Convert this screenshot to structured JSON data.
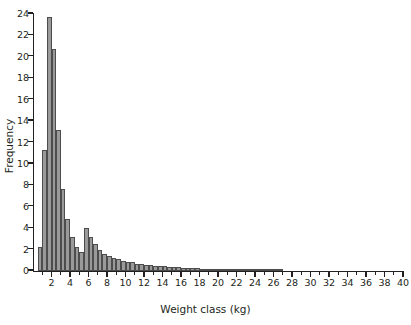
{
  "chart_data": {
    "type": "bar",
    "title": "",
    "subtitle": "",
    "xlabel": "Weight class (kg)",
    "ylabel": "Frequency",
    "xlim": [
      0,
      40
    ],
    "ylim": [
      0,
      24
    ],
    "grid": false,
    "legend": null,
    "bin_width": 0.5,
    "bar_color": "#9a9a9a",
    "bar_edge_color": "#4d4d4d",
    "axis_color": "#231f20",
    "background_color": "#ffffff",
    "x_tick_labels": [
      "2",
      "4",
      "6",
      "8",
      "10",
      "12",
      "14",
      "16",
      "18",
      "20",
      "22",
      "24",
      "26",
      "28",
      "30",
      "32",
      "34",
      "36",
      "38",
      "40"
    ],
    "x_tick_values": [
      2,
      4,
      6,
      8,
      10,
      12,
      14,
      16,
      18,
      20,
      22,
      24,
      26,
      28,
      30,
      32,
      34,
      36,
      38,
      40
    ],
    "x_minor_tick_values": [
      1,
      3,
      5,
      7,
      9,
      11,
      13,
      15,
      17,
      19,
      21,
      23,
      25,
      27,
      29,
      31,
      33,
      35,
      37,
      39
    ],
    "y_tick_labels": [
      "0",
      "2",
      "4",
      "6",
      "8",
      "10",
      "12",
      "14",
      "16",
      "18",
      "20",
      "22",
      "24"
    ],
    "y_tick_values": [
      0,
      2,
      4,
      6,
      8,
      10,
      12,
      14,
      16,
      18,
      20,
      22,
      24
    ],
    "bin_starts": [
      0.5,
      1.0,
      1.5,
      2.0,
      2.5,
      3.0,
      3.5,
      4.0,
      4.5,
      5.0,
      5.5,
      6.0,
      6.5,
      7.0,
      7.5,
      8.0,
      8.5,
      9.0,
      9.5,
      10.0,
      10.5,
      11.0,
      11.5,
      12.0,
      12.5,
      13.0,
      13.5,
      14.0,
      14.5,
      15.0,
      15.5,
      16.0,
      16.5,
      17.0,
      17.5,
      18.0,
      18.5,
      19.0,
      19.5,
      20.0,
      20.5,
      21.0,
      21.5,
      22.0,
      22.5,
      23.0,
      23.5,
      24.0,
      24.5,
      25.0,
      25.5,
      26.0,
      26.5
    ],
    "categories": [
      "0.5",
      "1.0",
      "1.5",
      "2.0",
      "2.5",
      "3.0",
      "3.5",
      "4.0",
      "4.5",
      "5.0",
      "5.5",
      "6.0",
      "6.5",
      "7.0",
      "7.5",
      "8.0",
      "8.5",
      "9.0",
      "9.5",
      "10.0",
      "10.5",
      "11.0",
      "11.5",
      "12.0",
      "12.5",
      "13.0",
      "13.5",
      "14.0",
      "14.5",
      "15.0",
      "15.5",
      "16.0",
      "16.5",
      "17.0",
      "17.5",
      "18.0",
      "18.5",
      "19.0",
      "19.5",
      "20.0",
      "20.5",
      "21.0",
      "21.5",
      "22.0",
      "22.5",
      "23.0",
      "23.5",
      "24.0",
      "24.5",
      "25.0",
      "25.5",
      "26.0",
      "26.5"
    ],
    "values": [
      2.2,
      11.3,
      23.7,
      20.7,
      13.2,
      7.7,
      4.9,
      3.2,
      2.2,
      1.8,
      4.0,
      3.2,
      2.5,
      2.0,
      1.6,
      1.4,
      1.2,
      1.1,
      0.95,
      0.85,
      0.8,
      0.7,
      0.65,
      0.6,
      0.55,
      0.5,
      0.5,
      0.45,
      0.4,
      0.4,
      0.35,
      0.3,
      0.3,
      0.28,
      0.25,
      0.22,
      0.2,
      0.2,
      0.18,
      0.15,
      0.15,
      0.12,
      0.1,
      0.1,
      0.1,
      0.08,
      0.08,
      0.06,
      0.05,
      0.05,
      0.04,
      0.04,
      0.03
    ]
  }
}
